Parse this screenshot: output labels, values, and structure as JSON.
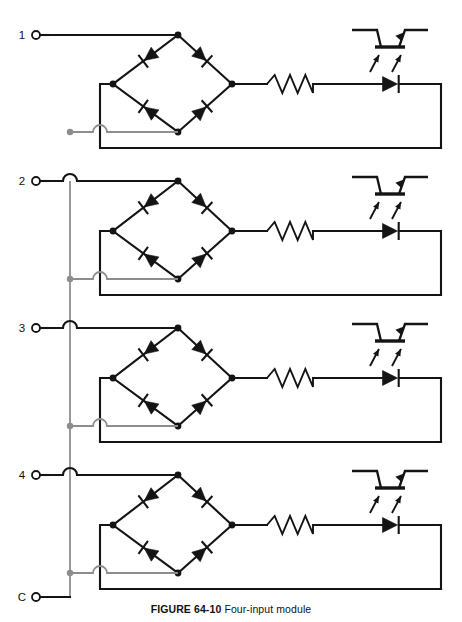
{
  "figure": {
    "caption_id": "FIGURE 64-10",
    "caption_text": "Four-input module",
    "title": "Four-input module",
    "background_color": "#ffffff",
    "line_color": "#141414",
    "secondary_line_color": "#8d8d8d"
  },
  "canvas": {
    "width": 462,
    "height": 622
  },
  "terminals": [
    {
      "label": "1",
      "x": 36,
      "y": 35,
      "name": "input-terminal-1"
    },
    {
      "label": "2",
      "x": 36,
      "y": 181,
      "name": "input-terminal-2"
    },
    {
      "label": "3",
      "x": 36,
      "y": 328,
      "name": "input-terminal-3"
    },
    {
      "label": "4",
      "x": 36,
      "y": 475,
      "name": "input-terminal-4"
    },
    {
      "label": "C",
      "x": 36,
      "y": 597,
      "name": "common-terminal-c"
    }
  ],
  "common_bus": {
    "label": "C",
    "x": 70,
    "y_top": 181,
    "y_bottom": 597
  },
  "channels": [
    {
      "index": 1,
      "input_label": "1",
      "y_top": 35,
      "y_mid": 84,
      "y_bottom": 132,
      "y_return": 148,
      "bridge": {
        "top_x": 178,
        "left_x": 113,
        "right_x": 232,
        "bottom_x": 178,
        "diodes": [
          "top-left",
          "top-right",
          "bottom-left",
          "bottom-right"
        ]
      },
      "resistor": {
        "x": 290,
        "y": 84,
        "peaks": 3
      },
      "optocoupler": {
        "led": {
          "x": 390,
          "y": 84
        },
        "phototransistor": {
          "x": 390,
          "y": 30
        },
        "rays": 2
      },
      "return_x": 441
    },
    {
      "index": 2,
      "input_label": "2",
      "y_top": 181,
      "y_mid": 231,
      "y_bottom": 279,
      "y_return": 295,
      "bridge": {
        "top_x": 178,
        "left_x": 113,
        "right_x": 232,
        "bottom_x": 178,
        "diodes": [
          "top-left",
          "top-right",
          "bottom-left",
          "bottom-right"
        ]
      },
      "resistor": {
        "x": 290,
        "y": 231,
        "peaks": 3
      },
      "optocoupler": {
        "led": {
          "x": 390,
          "y": 231
        },
        "phototransistor": {
          "x": 390,
          "y": 177
        },
        "rays": 2
      },
      "return_x": 441
    },
    {
      "index": 3,
      "input_label": "3",
      "y_top": 328,
      "y_mid": 378,
      "y_bottom": 426,
      "y_return": 442,
      "bridge": {
        "top_x": 178,
        "left_x": 113,
        "right_x": 232,
        "bottom_x": 178,
        "diodes": [
          "top-left",
          "top-right",
          "bottom-left",
          "bottom-right"
        ]
      },
      "resistor": {
        "x": 290,
        "y": 378,
        "peaks": 3
      },
      "optocoupler": {
        "led": {
          "x": 390,
          "y": 378
        },
        "phototransistor": {
          "x": 390,
          "y": 324
        },
        "rays": 2
      },
      "return_x": 441
    },
    {
      "index": 4,
      "input_label": "4",
      "y_top": 475,
      "y_mid": 525,
      "y_bottom": 573,
      "y_return": 589,
      "bridge": {
        "top_x": 178,
        "left_x": 113,
        "right_x": 232,
        "bottom_x": 178,
        "diodes": [
          "top-left",
          "top-right",
          "bottom-left",
          "bottom-right"
        ]
      },
      "resistor": {
        "x": 290,
        "y": 525,
        "peaks": 3
      },
      "optocoupler": {
        "led": {
          "x": 390,
          "y": 525
        },
        "phototransistor": {
          "x": 390,
          "y": 471
        },
        "rays": 2
      },
      "return_x": 441
    }
  ],
  "component_names": {
    "bridge": "bridge-rectifier",
    "diode": "diode",
    "resistor": "resistor",
    "led": "led",
    "phototransistor": "phototransistor",
    "optocoupler": "optocoupler",
    "wire": "wire",
    "junction": "junction-dot",
    "wire_hop": "wire-crossover-hop"
  }
}
